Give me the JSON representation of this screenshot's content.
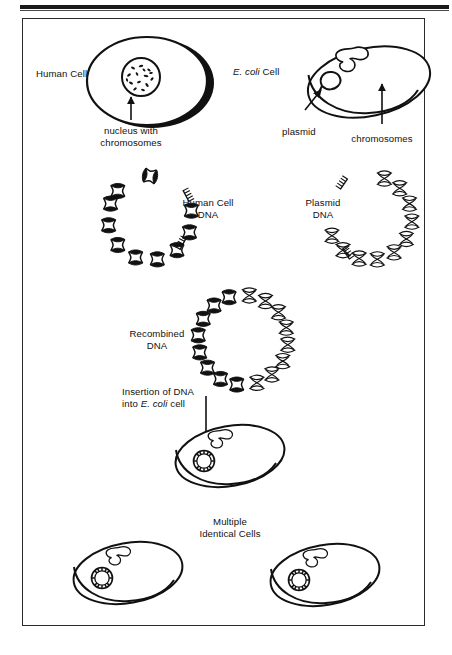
{
  "figure": {
    "title_visible": false,
    "background_color": "#ffffff",
    "ink_color": "#111111"
  },
  "labels": {
    "human_cell": "Human Cell",
    "ecoli_cell_italic": "E. coli",
    "ecoli_cell_rest": " Cell",
    "nucleus_line1": "nucleus with",
    "nucleus_line2": "chromosomes",
    "plasmid": "plasmid",
    "chromosomes": "chromosomes",
    "human_dna_line1": "Human Cell",
    "human_dna_line2": "DNA",
    "plasmid_dna_line1": "Plasmid",
    "plasmid_dna_line2": "DNA",
    "recombined_line1": "Recombined",
    "recombined_line2": "DNA",
    "insertion_line1": "Insertion of DNA",
    "insertion_line2_pre": "into ",
    "insertion_line2_italic": "E. coli",
    "insertion_line2_post": " cell",
    "multiple_line1": "Multiple",
    "multiple_line2": "Identical Cells"
  },
  "diagram": {
    "steps": [
      "Human cell contains a nucleus with chromosomes",
      "E. coli cell contains chromosomes and a plasmid",
      "Human cell DNA is cut out as an open helix fragment",
      "Plasmid DNA is cut open as an open helix fragment",
      "Fragments are joined into a closed circular recombined DNA molecule",
      "Recombined DNA is inserted into an E. coli cell",
      "The E. coli cell reproduces to yield multiple identical cells"
    ],
    "dna_fill_human": "#111111",
    "dna_fill_plasmid": "#ffffff"
  }
}
